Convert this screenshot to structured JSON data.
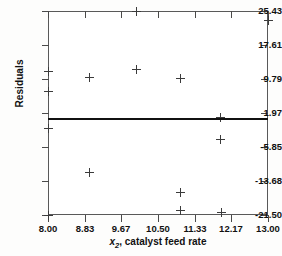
{
  "chart_data": {
    "type": "scatter",
    "title": "",
    "xlabel": "x2, catalyst feed rate",
    "xlabel_var": "x",
    "xlabel_sub": "2",
    "xlabel_rest": ", catalyst feed rate",
    "ylabel": "Residuals",
    "xlim": [
      8.0,
      13.0
    ],
    "ylim": [
      -21.5,
      25.43
    ],
    "xticks": [
      8.0,
      8.83,
      9.67,
      10.5,
      11.33,
      12.17,
      13.0
    ],
    "xtick_labels": [
      "8.00",
      "8.83",
      "9.67",
      "10.50",
      "11.33",
      "12.17",
      "13.00"
    ],
    "yticks": [
      25.43,
      17.61,
      9.79,
      1.97,
      -5.85,
      -13.68,
      -21.5
    ],
    "ytick_labels": [
      "25.43",
      "17.61",
      "9.79",
      "1.97",
      "-5.85",
      "-13.68",
      "-21.50"
    ],
    "grid": false,
    "legend": null,
    "marker": "plus",
    "marker_color": "#3b3b3b",
    "reference_line": {
      "orientation": "horizontal",
      "y": 0.55,
      "color": "#111111",
      "width": 2
    },
    "points": [
      {
        "x": 8.0,
        "y": 11.55
      },
      {
        "x": 8.0,
        "y": 6.9
      },
      {
        "x": 8.0,
        "y": -1.6
      },
      {
        "x": 8.0,
        "y": -21.5
      },
      {
        "x": 8.95,
        "y": 10.1
      },
      {
        "x": 8.95,
        "y": -11.7
      },
      {
        "x": 10.0,
        "y": 25.43
      },
      {
        "x": 10.0,
        "y": 12.05
      },
      {
        "x": 11.0,
        "y": 9.85
      },
      {
        "x": 11.02,
        "y": -16.35
      },
      {
        "x": 11.02,
        "y": -20.45
      },
      {
        "x": 11.92,
        "y": 0.95
      },
      {
        "x": 11.92,
        "y": -4.05
      },
      {
        "x": 11.95,
        "y": -20.95
      },
      {
        "x": 13.0,
        "y": 23.3
      }
    ],
    "n_points": 15
  }
}
